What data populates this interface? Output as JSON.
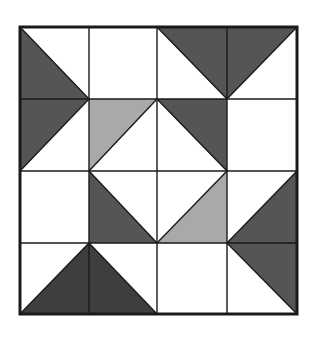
{
  "colors": {
    "background": "#ffffff",
    "line": "#1a1a1a",
    "dark": "#555555",
    "darker": "#3e3e3e",
    "light": "#a9a9a9"
  },
  "grid": {
    "rows": 4,
    "cols": 4,
    "x": [
      20,
      89,
      157,
      227,
      297
    ],
    "y": [
      27,
      99,
      171,
      243,
      314
    ],
    "outer_stroke_width": 3,
    "inner_stroke_width": 1.4
  },
  "shapes": [
    {
      "name": "left-dark-triangle",
      "fill": "dark",
      "points": [
        [
          20,
          27
        ],
        [
          89,
          99
        ],
        [
          20,
          171
        ]
      ]
    },
    {
      "name": "top-dark-triangle",
      "fill": "dark",
      "points": [
        [
          157,
          27
        ],
        [
          297,
          27
        ],
        [
          227,
          99
        ]
      ]
    },
    {
      "name": "center-topleft-light-triangle",
      "fill": "light",
      "points": [
        [
          89,
          99
        ],
        [
          157,
          99
        ],
        [
          89,
          171
        ]
      ]
    },
    {
      "name": "center-topright-dark-triangle",
      "fill": "dark",
      "points": [
        [
          157,
          99
        ],
        [
          227,
          99
        ],
        [
          227,
          171
        ]
      ]
    },
    {
      "name": "center-bottomleft-dark-triangle",
      "fill": "dark",
      "points": [
        [
          89,
          171
        ],
        [
          89,
          243
        ],
        [
          157,
          243
        ]
      ]
    },
    {
      "name": "center-bottomright-light-triangle",
      "fill": "light",
      "points": [
        [
          227,
          171
        ],
        [
          227,
          243
        ],
        [
          157,
          243
        ]
      ]
    },
    {
      "name": "right-dark-triangle",
      "fill": "dark",
      "points": [
        [
          297,
          171
        ],
        [
          297,
          314
        ],
        [
          227,
          243
        ]
      ]
    },
    {
      "name": "bottom-darker-triangle",
      "fill": "darker",
      "points": [
        [
          20,
          314
        ],
        [
          157,
          314
        ],
        [
          89,
          243
        ]
      ]
    }
  ],
  "diagonals": [
    [
      [
        20,
        27
      ],
      [
        89,
        99
      ]
    ],
    [
      [
        89,
        99
      ],
      [
        20,
        171
      ]
    ],
    [
      [
        157,
        27
      ],
      [
        227,
        99
      ]
    ],
    [
      [
        227,
        99
      ],
      [
        297,
        27
      ]
    ],
    [
      [
        89,
        171
      ],
      [
        157,
        99
      ]
    ],
    [
      [
        157,
        99
      ],
      [
        227,
        171
      ]
    ],
    [
      [
        227,
        171
      ],
      [
        157,
        243
      ]
    ],
    [
      [
        157,
        243
      ],
      [
        89,
        171
      ]
    ],
    [
      [
        227,
        243
      ],
      [
        297,
        171
      ]
    ],
    [
      [
        227,
        243
      ],
      [
        297,
        314
      ]
    ],
    [
      [
        20,
        314
      ],
      [
        89,
        243
      ]
    ],
    [
      [
        89,
        243
      ],
      [
        157,
        314
      ]
    ]
  ]
}
